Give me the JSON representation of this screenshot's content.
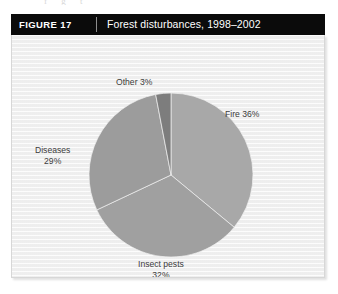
{
  "page": {
    "bleed_text": "f g t"
  },
  "figure": {
    "number_label": "FIGURE 17",
    "title": "Forest disturbances, 1998–2002",
    "header_bg": "#0b0b0b",
    "panel_bg": "#f3f3f3",
    "panel_border": "#d7d7d7"
  },
  "chart_data": {
    "type": "pie",
    "title": "Forest disturbances, 1998–2002",
    "xlabel": "",
    "ylabel": "",
    "legend_position": "none",
    "grid": false,
    "start_angle_deg": 0,
    "direction": "clockwise",
    "units": "percent",
    "categories": [
      "Fire",
      "Insect pests",
      "Diseases",
      "Other"
    ],
    "values": [
      36,
      32,
      29,
      3
    ],
    "colors": [
      "#a8a8a8",
      "#a0a0a0",
      "#9c9c9c",
      "#7d7d7d"
    ],
    "labels": [
      {
        "name": "Fire",
        "text": "Fire 36%",
        "value": 36,
        "lines": [
          "Fire 36%"
        ]
      },
      {
        "name": "Insect pests",
        "text": "Insect pests 32%",
        "value": 32,
        "lines": [
          "Insect pests",
          "32%"
        ]
      },
      {
        "name": "Diseases",
        "text": "Diseases 29%",
        "value": 29,
        "lines": [
          "Diseases",
          "29%"
        ]
      },
      {
        "name": "Other",
        "text": "Other 3%",
        "value": 3,
        "lines": [
          "Other 3%"
        ]
      }
    ],
    "label_text": {
      "other": "Other 3%",
      "fire": "Fire 36%",
      "diseases_line1": "Diseases",
      "diseases_line2": "29%",
      "insect_line1": "Insect pests",
      "insect_line2": "32%"
    }
  }
}
